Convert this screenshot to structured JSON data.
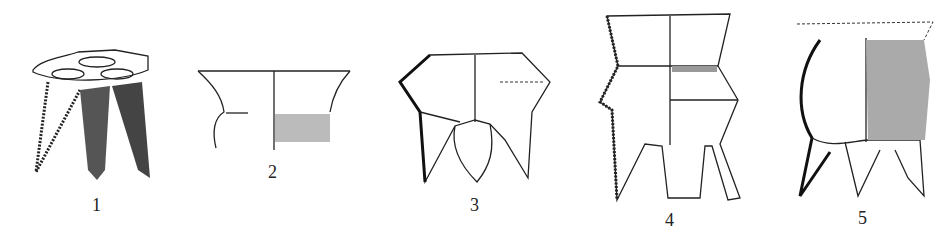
{
  "figure": {
    "vessels": [
      {
        "label": "1"
      },
      {
        "label": "2"
      },
      {
        "label": "3"
      },
      {
        "label": "4"
      },
      {
        "label": "5"
      }
    ]
  }
}
